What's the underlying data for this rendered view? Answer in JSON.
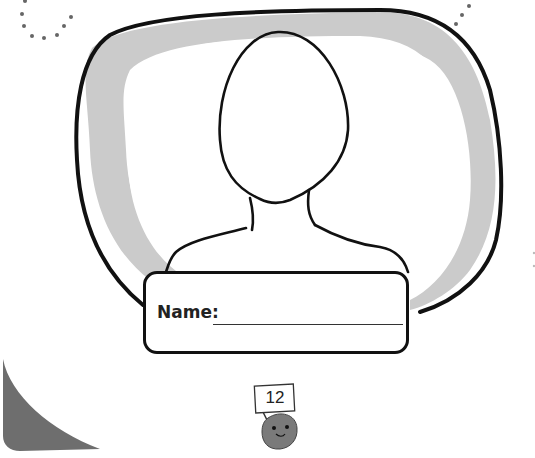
{
  "worksheet": {
    "name_label": "Name:",
    "name_field_value": "",
    "page_number": "12"
  },
  "colors": {
    "outline": "#111111",
    "frame_shadow": "#c8c8c8",
    "corner_shape": "#6e6e6e",
    "mascot_body": "#7a7a7a",
    "dots": "#666666"
  }
}
